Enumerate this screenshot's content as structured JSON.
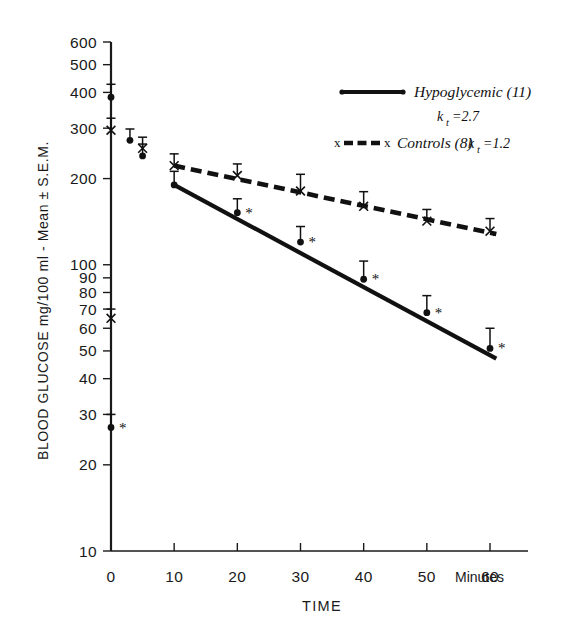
{
  "chart_data": {
    "type": "line",
    "title": "",
    "xlabel": "TIME",
    "xunit": "Minutes",
    "ylabel": "BLOOD  GLUCOSE  mg/100 ml - Mean ± S.E.M.",
    "yscale": "log",
    "ylim": [
      10,
      600
    ],
    "xlim": [
      0,
      63
    ],
    "grid": false,
    "legend_position": "upper-right",
    "x_ticks": [
      "0",
      "10",
      "20",
      "30",
      "40",
      "50",
      "60"
    ],
    "x_tick_values": [
      0,
      10,
      20,
      30,
      40,
      50,
      60
    ],
    "y_ticks": [
      "600",
      "500",
      "400",
      "300",
      "200",
      "100",
      "90",
      "80",
      "70",
      "60",
      "50",
      "40",
      "30",
      "20",
      "10"
    ],
    "y_tick_values": [
      600,
      500,
      400,
      300,
      200,
      100,
      90,
      80,
      70,
      60,
      50,
      40,
      30,
      20,
      10
    ],
    "series": [
      {
        "name": "Hypoglycemic (11)",
        "n": 11,
        "kt": "2.7",
        "marker": "filled-circle",
        "linestyle": "solid",
        "x": [
          0,
          0,
          3,
          5,
          10,
          20,
          30,
          40,
          50,
          60
        ],
        "values": [
          385,
          27,
          272,
          240,
          190,
          152,
          120,
          89,
          68,
          51
        ],
        "errors": [
          42,
          3,
          26,
          24,
          22,
          18,
          16,
          14,
          10,
          9
        ],
        "significance": [
          false,
          true,
          false,
          false,
          false,
          true,
          true,
          true,
          true,
          true
        ]
      },
      {
        "name": "Controls (8)",
        "n": 8,
        "kt": "1.2",
        "marker": "cross-x",
        "linestyle": "dashed",
        "x": [
          0,
          0,
          5,
          10,
          20,
          30,
          40,
          50,
          60
        ],
        "values": [
          295,
          65,
          255,
          222,
          205,
          181,
          160,
          142,
          131
        ],
        "errors": [
          30,
          5,
          24,
          22,
          20,
          26,
          20,
          14,
          14
        ],
        "significance": [
          false,
          false,
          false,
          false,
          false,
          false,
          false,
          false,
          false
        ]
      }
    ],
    "fit_lines": [
      {
        "name": "Hypoglycemic (11) fit",
        "x0": 10,
        "y0": 190,
        "x1": 61,
        "y1": 47
      },
      {
        "name": "Controls (8) fit",
        "x0": 10,
        "y0": 222,
        "x1": 61,
        "y1": 128
      }
    ],
    "annotations": [
      "* denotes significant difference from controls"
    ]
  },
  "legend": {
    "entries": [
      {
        "label": "Hypoglycemic (11)",
        "sub_prefix": "k",
        "sub_subscript": "t",
        "sub_value": "=2.7"
      },
      {
        "label": "Controls (8) ",
        "sub_prefix": "k",
        "sub_subscript": "t",
        "sub_value": "=1.2"
      }
    ]
  },
  "axes": {
    "x_title": "TIME",
    "x_unit_label": "Minutes",
    "y_title": "BLOOD  GLUCOSE  mg/100 ml - Mean ± S.E.M."
  }
}
